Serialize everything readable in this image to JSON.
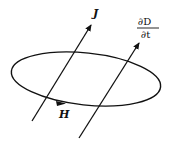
{
  "diagram": {
    "labels": {
      "current_density": "J",
      "magnetic_field": "H",
      "displacement_numerator": "∂D",
      "displacement_denominator": "∂t"
    },
    "colors": {
      "stroke": "#111111",
      "background": "#ffffff"
    }
  }
}
